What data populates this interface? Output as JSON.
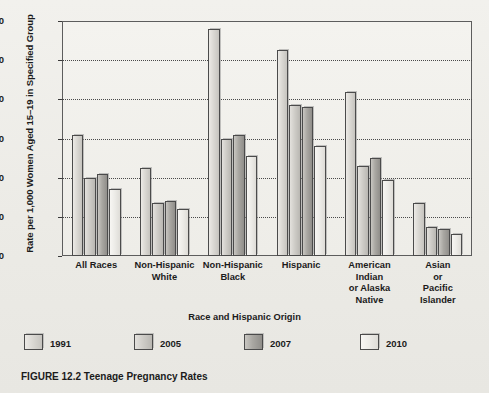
{
  "caption": "FIGURE 12.2  Teenage Pregnancy Rates",
  "axis": {
    "ylabel": "Rate per 1,000 Women Aged 15–19 in Specified Group",
    "xlabel": "Race and Hispanic Origin",
    "yticks": [
      "0",
      "20",
      "40",
      "60",
      "80",
      "100",
      "120"
    ]
  },
  "legend": {
    "items": [
      {
        "label": "1991",
        "color": "#d9d7d2"
      },
      {
        "label": "2005",
        "color": "#cfcdc8"
      },
      {
        "label": "2007",
        "color": "#a9a7a2"
      },
      {
        "label": "2010",
        "color": "#ecebe7"
      }
    ]
  },
  "chart_data": {
    "type": "bar",
    "title": "Teenage Pregnancy Rates",
    "xlabel": "Race and Hispanic Origin",
    "ylabel": "Rate per 1,000 Women Aged 15–19 in Specified Group",
    "ylim": [
      0,
      120
    ],
    "ytick_step": 20,
    "grid": true,
    "legend_position": "below-plot",
    "categories": [
      "All Races",
      "Non-Hispanic White",
      "Non-Hispanic Black",
      "Hispanic",
      "American Indian or Alaska Native",
      "Asian or Pacific Islander"
    ],
    "category_lines": [
      [
        "All Races"
      ],
      [
        "Non-Hispanic",
        "White"
      ],
      [
        "Non-Hispanic",
        "Black"
      ],
      [
        "Hispanic"
      ],
      [
        "American",
        "Indian",
        "or Alaska",
        "Native"
      ],
      [
        "Asian",
        "or",
        "Pacific",
        "Islander"
      ]
    ],
    "series": [
      {
        "name": "1991",
        "values": [
          62,
          45,
          116,
          105,
          84,
          27
        ]
      },
      {
        "name": "2005",
        "values": [
          40,
          27,
          60,
          77,
          46,
          15
        ]
      },
      {
        "name": "2007",
        "values": [
          42,
          28,
          62,
          76,
          50,
          14
        ]
      },
      {
        "name": "2010",
        "values": [
          34,
          24,
          51,
          56,
          39,
          11
        ]
      }
    ]
  }
}
